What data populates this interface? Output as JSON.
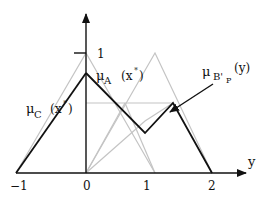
{
  "diagram": {
    "axis": {
      "x_label": "y",
      "y_tick": "1",
      "x_ticks": [
        "−1",
        "0",
        "1",
        "2"
      ]
    },
    "labels": {
      "mu_a": {
        "mu": "μ",
        "sub": "A",
        "arg": "(x",
        "sup": "*",
        "close": ")"
      },
      "mu_c": {
        "mu": "μ",
        "sub": "C",
        "arg": "(x",
        "sup": "*",
        "close": ")"
      },
      "mu_bp": {
        "mu": "μ",
        "sub": "B'",
        "subsub": "P",
        "arg": "(y)"
      }
    },
    "colors": {
      "foreground": "#111111",
      "gray": "#c0c0c0"
    }
  }
}
